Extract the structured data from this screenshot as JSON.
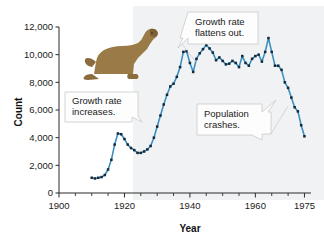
{
  "chart_data": {
    "type": "line",
    "title": "",
    "xlabel": "Year",
    "ylabel": "Count",
    "xlim": [
      1900,
      1977
    ],
    "ylim": [
      0,
      12000
    ],
    "grid": false,
    "legend": "none",
    "x_ticks": [
      "1900",
      "1920",
      "1940",
      "1960",
      "1975"
    ],
    "x_tick_values": [
      1900,
      1920,
      1940,
      1960,
      1975
    ],
    "x_minor_tick_values": [
      1905,
      1910,
      1915,
      1925,
      1930,
      1935,
      1945,
      1950,
      1955,
      1965,
      1970
    ],
    "y_ticks": [
      "0",
      "2,000",
      "4,000",
      "6,000",
      "8,000",
      "10,000",
      "12,000"
    ],
    "y_tick_values": [
      0,
      2000,
      4000,
      6000,
      8000,
      10000,
      12000
    ],
    "series": [
      {
        "name": "Fur seal population",
        "line_color": "#3d8fbf",
        "marker_color": "#14293b",
        "x": [
          1910,
          1911,
          1912,
          1913,
          1914,
          1915,
          1916,
          1917,
          1918,
          1919,
          1920,
          1921,
          1922,
          1923,
          1924,
          1925,
          1926,
          1927,
          1928,
          1929,
          1930,
          1931,
          1932,
          1933,
          1934,
          1935,
          1936,
          1937,
          1938,
          1939,
          1940,
          1941,
          1942,
          1943,
          1944,
          1945,
          1946,
          1947,
          1948,
          1949,
          1950,
          1951,
          1952,
          1953,
          1954,
          1955,
          1956,
          1957,
          1958,
          1959,
          1960,
          1961,
          1962,
          1963,
          1964,
          1965,
          1966,
          1967,
          1968,
          1969,
          1970,
          1971,
          1972,
          1973,
          1974,
          1975
        ],
        "y": [
          1100,
          1050,
          1100,
          1150,
          1300,
          1700,
          2400,
          3500,
          4300,
          4250,
          3900,
          3500,
          3250,
          3100,
          2900,
          2900,
          3000,
          3150,
          3400,
          4000,
          4800,
          5600,
          6400,
          7100,
          7700,
          7900,
          8400,
          9100,
          10200,
          10250,
          9400,
          8750,
          9700,
          10100,
          10400,
          10700,
          10450,
          10150,
          9600,
          9800,
          9550,
          9300,
          9350,
          9550,
          9400,
          9100,
          9900,
          9400,
          9200,
          9700,
          9900,
          10000,
          9500,
          10200,
          11200,
          10200,
          9200,
          9200,
          8900,
          8000,
          7600,
          6900,
          6200,
          5900,
          4900,
          4100
        ]
      }
    ],
    "annotations": [
      {
        "id": "growth-increases",
        "text_line1": "Growth rate",
        "text_line2": "increases.",
        "points_to": "steep rising segment near 1930"
      },
      {
        "id": "growth-flattens",
        "text_line1": "Growth rate",
        "text_line2": "flattens out.",
        "points_to": "plateau near 1950"
      },
      {
        "id": "population-crashes",
        "text_line1": "Population",
        "text_line2": "crashes.",
        "points_to": "declining segment near 1970"
      }
    ],
    "decorations": [
      {
        "id": "fur-seal-illustration",
        "description": "brown fur seal illustration",
        "color": "#9a7a46"
      }
    ]
  }
}
